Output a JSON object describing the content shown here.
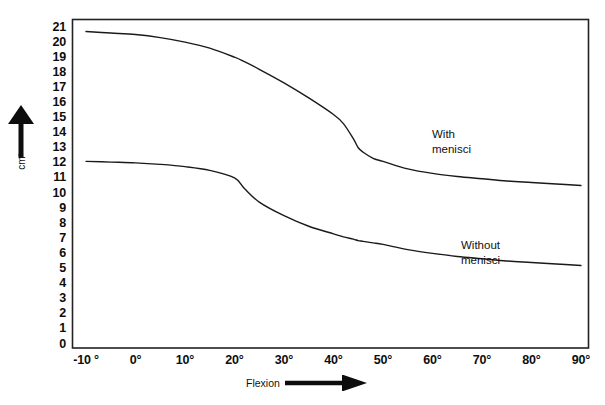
{
  "chart_data": {
    "type": "line",
    "title": "",
    "subtitle": "",
    "xlabel": "Flexion",
    "ylabel": "cm²",
    "xlim": [
      -10,
      90
    ],
    "ylim": [
      0,
      21
    ],
    "grid": false,
    "legend_position": "inline-annotation",
    "x_ticklabels": [
      "-10 °",
      "0°",
      "10°",
      "20°",
      "30°",
      "40°",
      "50°",
      "60°",
      "70°",
      "80°",
      "90°"
    ],
    "x_tickvalues": [
      -10,
      0,
      10,
      20,
      30,
      40,
      50,
      60,
      70,
      80,
      90
    ],
    "y_ticklabels": [
      "21",
      "20",
      "19",
      "18",
      "17",
      "16",
      "15",
      "14",
      "13",
      "12",
      "11",
      "10",
      "9",
      "8",
      "7",
      "6",
      "5",
      "4",
      "3",
      "2",
      "1",
      "0"
    ],
    "y_tickvalues": [
      21,
      20,
      19,
      18,
      17,
      16,
      15,
      14,
      13,
      12,
      11,
      10,
      9,
      8,
      7,
      6,
      5,
      4,
      3,
      2,
      1,
      0
    ],
    "x": [
      -10,
      -5,
      0,
      5,
      10,
      15,
      20,
      22,
      25,
      30,
      35,
      40,
      42,
      44,
      45,
      46,
      48,
      50,
      55,
      60,
      65,
      70,
      75,
      80,
      85,
      90
    ],
    "series": [
      {
        "name": "With menisci",
        "annotation": "With\nmenisci",
        "color": "#1a1a1a",
        "values": [
          20.7,
          20.6,
          20.5,
          20.3,
          20.0,
          19.6,
          19.0,
          18.7,
          18.2,
          17.3,
          16.3,
          15.2,
          14.6,
          13.6,
          13.0,
          12.7,
          12.3,
          12.1,
          11.6,
          11.3,
          11.1,
          10.95,
          10.8,
          10.7,
          10.6,
          10.5
        ]
      },
      {
        "name": "Without menisci",
        "annotation": "Without\nmenisci",
        "color": "#1a1a1a",
        "values": [
          12.1,
          12.05,
          12.0,
          11.9,
          11.75,
          11.5,
          11.0,
          10.3,
          9.4,
          8.5,
          7.8,
          7.3,
          7.1,
          6.95,
          6.85,
          6.8,
          6.7,
          6.6,
          6.25,
          6.0,
          5.8,
          5.65,
          5.5,
          5.4,
          5.3,
          5.2
        ]
      }
    ],
    "axis_color": "#222222",
    "line_width": 1.4
  },
  "axis_arrows": {
    "y_arrow": "up-arrow-icon",
    "x_arrow": "right-arrow-icon"
  }
}
